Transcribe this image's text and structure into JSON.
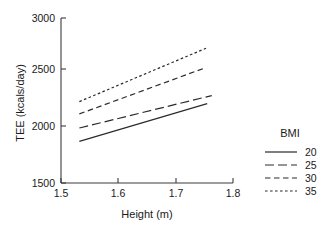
{
  "chart_data": {
    "type": "line",
    "title": "",
    "xlabel": "Height (m)",
    "ylabel": "TEE (kcals/day)",
    "xlim": [
      1.5,
      1.8
    ],
    "ylim": [
      1500,
      3000
    ],
    "xticks": [
      1.5,
      1.6,
      1.7,
      1.8
    ],
    "xtick_labels": [
      "1.5",
      "1.6",
      "1.7",
      "1.8"
    ],
    "yticks": [
      1500,
      2000,
      2500,
      3000
    ],
    "ytick_labels": [
      "1500",
      "2000",
      "2500",
      "3000"
    ],
    "grid": false,
    "legend_title": "BMI",
    "legend_position": "right",
    "series": [
      {
        "name": "20",
        "dash": "solid",
        "x": [
          1.532,
          1.755
        ],
        "y": [
          1878,
          2222
        ]
      },
      {
        "name": "25",
        "dash": "long-dash",
        "x": [
          1.532,
          1.763
        ],
        "y": [
          2000,
          2295
        ]
      },
      {
        "name": "30",
        "dash": "medium-dash",
        "x": [
          1.532,
          1.752
        ],
        "y": [
          2128,
          2548
        ]
      },
      {
        "name": "35",
        "dash": "short-dash",
        "x": [
          1.532,
          1.753
        ],
        "y": [
          2240,
          2725
        ]
      }
    ]
  },
  "legend": {
    "title": "BMI",
    "entries": [
      {
        "label": "20",
        "dash": "solid"
      },
      {
        "label": "25",
        "dash": "long-dash"
      },
      {
        "label": "30",
        "dash": "medium-dash"
      },
      {
        "label": "35",
        "dash": "short-dash"
      }
    ]
  },
  "colors": {
    "line": "#2b2b2b",
    "axis": "#3b3b3b",
    "text": "#1a1a1a",
    "background": "#ffffff"
  }
}
